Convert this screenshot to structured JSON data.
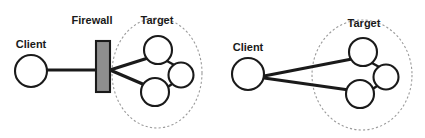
{
  "figure": {
    "title": "",
    "background_color": "#ffffff",
    "width": 425,
    "height": 138
  },
  "colors": {
    "node_stroke": "#1a1a1a",
    "node_fill": "#ffffff",
    "link": "#1a1a1a",
    "group_boundary": "#9a9a9a",
    "firewall_fill": "#8e8e8e",
    "label_text": "#1a1a1a"
  },
  "panels": [
    {
      "id": "left",
      "name": "firewalled-scan",
      "labels": {
        "client": "Client",
        "firewall": "Firewall",
        "target": "Target"
      },
      "nodes": [
        {
          "name": "client",
          "label": "Client",
          "cx": 31,
          "cy": 71,
          "r": 16
        },
        {
          "name": "target-node-top",
          "label": "",
          "cx": 158,
          "cy": 50,
          "r": 14
        },
        {
          "name": "target-node-right",
          "label": "",
          "cx": 181,
          "cy": 75,
          "r": 12.5
        },
        {
          "name": "target-node-bottom",
          "label": "",
          "cx": 155,
          "cy": 92,
          "r": 14
        }
      ],
      "firewall": {
        "name": "firewall",
        "x": 96,
        "y": 41,
        "width": 14,
        "height": 51
      },
      "group": {
        "name": "target-group",
        "cx": 157,
        "cy": 73,
        "rx": 45,
        "ry": 55
      },
      "links": [
        {
          "from": "client",
          "to": "firewall"
        },
        {
          "from": "firewall",
          "to": "target-node-top"
        },
        {
          "from": "firewall",
          "to": "target-node-bottom"
        },
        {
          "from": "target-node-top",
          "to": "target-node-right"
        },
        {
          "from": "target-node-right",
          "to": "target-node-bottom"
        }
      ]
    },
    {
      "id": "right",
      "name": "direct-scan",
      "labels": {
        "client": "Client",
        "target": "Target"
      },
      "nodes": [
        {
          "name": "client",
          "label": "Client",
          "cx": 248,
          "cy": 74,
          "r": 16
        },
        {
          "name": "target-node-top",
          "label": "",
          "cx": 363,
          "cy": 52,
          "r": 14
        },
        {
          "name": "target-node-right",
          "label": "",
          "cx": 386,
          "cy": 77,
          "r": 12.5
        },
        {
          "name": "target-node-bottom",
          "label": "",
          "cx": 360,
          "cy": 94,
          "r": 14
        }
      ],
      "group": {
        "name": "target-group",
        "cx": 362,
        "cy": 75,
        "rx": 50,
        "ry": 55
      },
      "links": [
        {
          "from": "client",
          "to": "target-node-top"
        },
        {
          "from": "client",
          "to": "target-node-bottom"
        },
        {
          "from": "target-node-top",
          "to": "target-node-right"
        },
        {
          "from": "target-node-right",
          "to": "target-node-bottom"
        }
      ]
    }
  ]
}
